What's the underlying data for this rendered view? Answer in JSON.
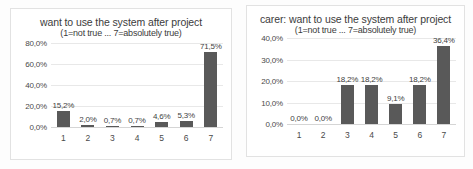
{
  "chart_data": [
    {
      "id": "left",
      "type": "bar",
      "title": "want to use the system after project",
      "subtitle": "(1=not true ... 7=absolutely true)",
      "xlabel": "",
      "ylabel": "",
      "categories": [
        "1",
        "2",
        "3",
        "4",
        "5",
        "6",
        "7"
      ],
      "values": [
        15.2,
        2.0,
        0.7,
        0.7,
        4.6,
        5.3,
        71.5
      ],
      "data_labels": [
        "15,2%",
        "2,0%",
        "0,7%",
        "0,7%",
        "4,6%",
        "5,3%",
        "71,5%"
      ],
      "ylim": [
        0,
        80
      ],
      "ytick_values": [
        0,
        20,
        40,
        60,
        80
      ],
      "ytick_labels": [
        "0,0%",
        "20,0%",
        "40,0%",
        "60,0%",
        "80,0%"
      ],
      "grid": true,
      "legend": "none",
      "bar_color": "#595959"
    },
    {
      "id": "right",
      "type": "bar",
      "title": "carer: want to use the system after project",
      "subtitle": "(1=not true ... 7=absolutely true)",
      "xlabel": "",
      "ylabel": "",
      "categories": [
        "1",
        "2",
        "3",
        "4",
        "5",
        "6",
        "7"
      ],
      "values": [
        0.0,
        0.0,
        18.2,
        18.2,
        9.1,
        18.2,
        36.4
      ],
      "data_labels": [
        "0,0%",
        "0,0%",
        "18,2%",
        "18,2%",
        "9,1%",
        "18,2%",
        "36,4%"
      ],
      "ylim": [
        0,
        40
      ],
      "ytick_values": [
        0,
        10,
        20,
        30,
        40
      ],
      "ytick_labels": [
        "0,0%",
        "10,0%",
        "20,0%",
        "30,0%",
        "40,0%"
      ],
      "grid": true,
      "legend": "none",
      "bar_color": "#595959"
    }
  ]
}
